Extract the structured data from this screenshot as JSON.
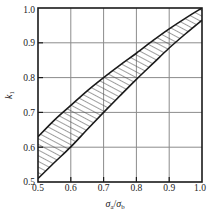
{
  "chart_data": {
    "type": "area",
    "title": "",
    "subtitle": "",
    "xlabel": "σa/σb",
    "xlabel_parts": {
      "sym1": "σ",
      "sub1": "a",
      "slash": "/",
      "sym2": "σ",
      "sub2": "b"
    },
    "ylabel": "k1",
    "ylabel_parts": {
      "sym": "k",
      "sub": "1"
    },
    "xlim": [
      0.5,
      1.0
    ],
    "ylim": [
      0.5,
      1.0
    ],
    "xticks": [
      0.5,
      0.6,
      0.7,
      0.8,
      0.9,
      1.0
    ],
    "yticks": [
      0.5,
      0.6,
      0.7,
      0.8,
      0.9,
      1.0
    ],
    "xtick_labels": [
      "0.5",
      "0.6",
      "0.7",
      "0.8",
      "0.9",
      "1.0"
    ],
    "ytick_labels": [
      "0.5",
      "0.6",
      "0.7",
      "0.8",
      "0.9",
      "1.0"
    ],
    "grid": true,
    "legend": null,
    "legend_position": "none",
    "band_fill": "hatched",
    "hatch_angle_deg": 62,
    "line_color": "#1a1a1a",
    "grid_color": "#8c8c8c",
    "frame_color": "#1a1a1a",
    "hatch_color": "#4d4d4d",
    "x": [
      0.5,
      0.55,
      0.6,
      0.65,
      0.7,
      0.75,
      0.8,
      0.85,
      0.9,
      0.95,
      1.0
    ],
    "series": [
      {
        "name": "upper bound",
        "values": [
          0.63,
          0.678,
          0.72,
          0.762,
          0.8,
          0.836,
          0.87,
          0.906,
          0.94,
          0.971,
          1.0
        ]
      },
      {
        "name": "lower bound",
        "values": [
          0.51,
          0.556,
          0.601,
          0.651,
          0.7,
          0.748,
          0.795,
          0.84,
          0.885,
          0.926,
          0.965
        ]
      }
    ]
  },
  "figure": {
    "plot_left": 38,
    "plot_top": 8,
    "plot_right": 202,
    "plot_bottom": 182
  }
}
